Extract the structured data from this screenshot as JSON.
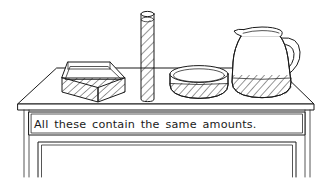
{
  "illustration": {
    "title": "All these contain the same amounts",
    "style": "black-and-white line drawing",
    "background_color": "#ffffff",
    "ink_color": "#1a1a1a"
  },
  "caption": {
    "text": "All these contain the same  amounts.",
    "panel_name": "table-apron-caption-panel"
  },
  "furniture": {
    "table": {
      "label": "table",
      "parts": [
        "tabletop-perspective-surface",
        "tabletop-front-edge",
        "apron-caption-panel",
        "left-leg",
        "right-leg",
        "lower-frame-panel"
      ]
    }
  },
  "containers": [
    {
      "id": "box",
      "label": "rectangular open box",
      "fill_pattern": "diagonal-hatching",
      "fill_level": "nearly full"
    },
    {
      "id": "cylinder",
      "label": "tall narrow cylinder",
      "fill_pattern": "diagonal-hatching",
      "fill_level": "nearly full"
    },
    {
      "id": "bowl",
      "label": "shallow round bowl",
      "fill_pattern": "diagonal-hatching",
      "fill_level": "lower portion"
    },
    {
      "id": "pitcher",
      "label": "pitcher with handle and spout",
      "fill_pattern": "diagonal-hatching",
      "fill_level": "bottom portion"
    }
  ]
}
